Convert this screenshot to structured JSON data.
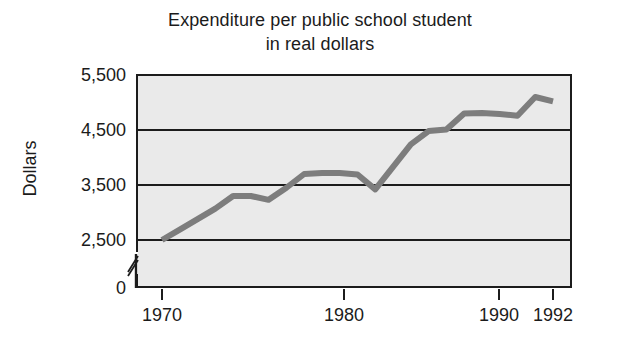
{
  "chart_data": {
    "type": "line",
    "title": "Expenditure per public school student in real dollars",
    "title_lines": [
      "Expenditure per public school student",
      "in real dollars"
    ],
    "xlabel": "",
    "ylabel": "Dollars",
    "x": [
      1970,
      1971,
      1972,
      1973,
      1974,
      1975,
      1976,
      1977,
      1978,
      1979,
      1980,
      1981,
      1982,
      1983,
      1984,
      1985,
      1986,
      1987,
      1988,
      1989,
      1990,
      1991,
      1992
    ],
    "values": [
      2500,
      2690,
      2880,
      3070,
      3300,
      3300,
      3230,
      3450,
      3700,
      3720,
      3720,
      3690,
      3420,
      3830,
      4240,
      4480,
      4510,
      4800,
      4810,
      4790,
      4760,
      5100,
      5020
    ],
    "series": [
      {
        "name": "Expenditure per public school student (real dollars)",
        "values": [
          2500,
          2690,
          2880,
          3070,
          3300,
          3300,
          3230,
          3450,
          3700,
          3720,
          3720,
          3690,
          3420,
          3830,
          4240,
          4480,
          4510,
          4800,
          4810,
          4790,
          4760,
          5100,
          5020
        ],
        "color": "#7d7d7d"
      }
    ],
    "xlim": [
      1969,
      1993
    ],
    "ylim": [
      0,
      5500
    ],
    "xticks": [
      1970,
      1980,
      1990,
      1992
    ],
    "xticklabels": [
      "1970",
      "1980",
      "1990",
      "1992"
    ],
    "yticks": [
      0,
      2500,
      3500,
      4500,
      5500
    ],
    "yticklabels": [
      "0",
      "2,500",
      "3,500",
      "4,500",
      "5,500"
    ],
    "gridlines": [
      2500,
      3500,
      4500
    ],
    "grid": true,
    "axis_break": {
      "axis": "y",
      "between": [
        0,
        2500
      ],
      "symbol": "double-slash"
    },
    "legend": null,
    "plot_background": "#eaeaea",
    "axis_color": "#1c1c1c",
    "figure_background": "#ffffff"
  }
}
